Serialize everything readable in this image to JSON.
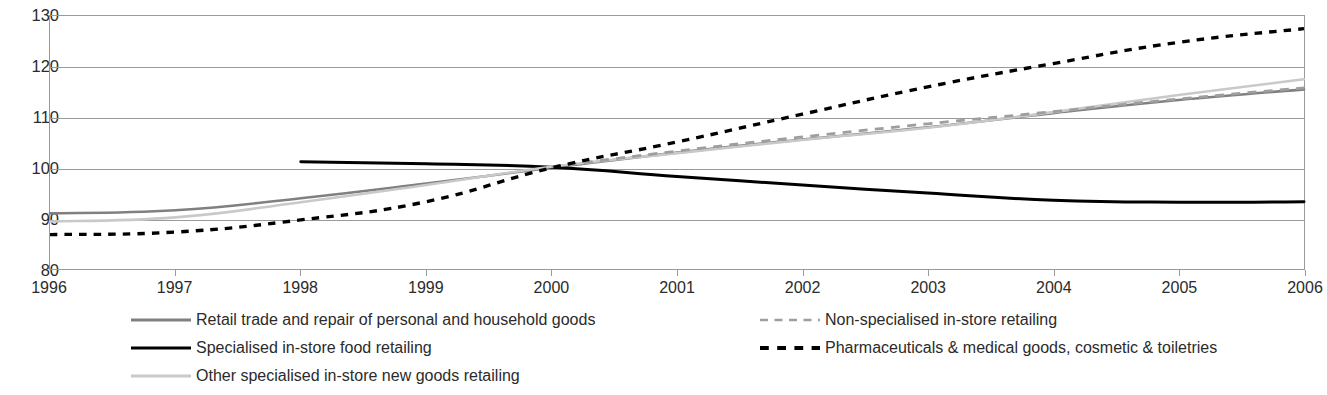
{
  "chart_data": {
    "type": "line",
    "title": "",
    "subtitle": "",
    "xlabel": "",
    "ylabel": "",
    "x": [
      1996,
      1997,
      1998,
      1999,
      2000,
      2001,
      2002,
      2003,
      2004,
      2005,
      2006
    ],
    "categories": [
      "1996",
      "1997",
      "1998",
      "1999",
      "2000",
      "2001",
      "2002",
      "2003",
      "2004",
      "2005",
      "2006"
    ],
    "xlim": [
      1996,
      2006
    ],
    "ylim": [
      80,
      130
    ],
    "yticks": [
      80,
      90,
      100,
      110,
      120,
      130
    ],
    "grid": true,
    "legend_position": "bottom",
    "index_base_year": 2000,
    "index_base_value": 100,
    "series": [
      {
        "name": "Retail trade and repair of personal and household goods",
        "color": "#808080",
        "style": "solid",
        "width": 2.6,
        "x": [
          1996,
          1997,
          1998,
          1999,
          2000,
          2001,
          2002,
          2003,
          2004,
          2005,
          2006
        ],
        "values": [
          91.0,
          91.6,
          94.0,
          96.9,
          100.0,
          103.0,
          105.6,
          108.0,
          110.8,
          113.4,
          115.5
        ]
      },
      {
        "name": "Specialised in-store food retailing",
        "color": "#000000",
        "style": "solid",
        "width": 3.0,
        "x": [
          1998,
          1999,
          2000,
          2001,
          2002,
          2003,
          2004,
          2005,
          2006
        ],
        "values": [
          101.2,
          100.8,
          100.1,
          98.3,
          96.6,
          95.0,
          93.6,
          93.2,
          93.3
        ]
      },
      {
        "name": "Other specialised in-store new goods retailing",
        "color": "#c9c9c9",
        "style": "solid",
        "width": 2.6,
        "x": [
          1996,
          1997,
          1998,
          1999,
          2000,
          2001,
          2002,
          2003,
          2004,
          2005,
          2006
        ],
        "values": [
          89.4,
          90.2,
          93.2,
          96.6,
          100.2,
          102.9,
          105.5,
          107.9,
          111.0,
          114.4,
          117.5
        ]
      },
      {
        "name": "Non-specialised in-store retailing",
        "color": "#9e9e9e",
        "style": "dashed",
        "width": 2.8,
        "x": [
          2000,
          2001,
          2002,
          2003,
          2004,
          2005,
          2006
        ],
        "values": [
          100.2,
          103.3,
          106.1,
          108.7,
          111.1,
          113.6,
          115.8
        ]
      },
      {
        "name": "Pharmaceuticals & medical goods, cosmetic & toiletries",
        "color": "#000000",
        "style": "dotted",
        "width": 3.4,
        "x": [
          1996,
          1997,
          1998,
          1999,
          2000,
          2001,
          2002,
          2003,
          2004,
          2005,
          2006
        ],
        "values": [
          86.8,
          87.3,
          89.7,
          93.3,
          100.0,
          105.1,
          110.6,
          116.0,
          120.6,
          124.8,
          127.5
        ]
      }
    ]
  },
  "axis": {
    "y_tick_labels": [
      "130",
      "120",
      "110",
      "100",
      "90",
      "80"
    ],
    "x_tick_labels": [
      "1996",
      "1997",
      "1998",
      "1999",
      "2000",
      "2001",
      "2002",
      "2003",
      "2004",
      "2005",
      "2006"
    ]
  },
  "legend": {
    "entries": [
      {
        "label": "Retail trade and repair of personal and household goods",
        "icon": "solid-line-swatch-gray",
        "color": "#808080",
        "style": "solid",
        "column": "left",
        "row": 0
      },
      {
        "label": "Specialised in-store food retailing",
        "icon": "solid-line-swatch-black",
        "color": "#000000",
        "style": "solid",
        "column": "left",
        "row": 1
      },
      {
        "label": "Other specialised in-store new goods retailing",
        "icon": "solid-line-swatch-light-gray",
        "color": "#c9c9c9",
        "style": "solid",
        "column": "left",
        "row": 2
      },
      {
        "label": "Non-specialised in-store retailing",
        "icon": "dashed-line-swatch-gray",
        "color": "#9e9e9e",
        "style": "dashed",
        "column": "right",
        "row": 0
      },
      {
        "label": "Pharmaceuticals & medical goods, cosmetic & toiletries",
        "icon": "dotted-line-swatch-black",
        "color": "#000000",
        "style": "dotted",
        "column": "right",
        "row": 1
      }
    ]
  },
  "colors": {
    "background": "#ffffff",
    "axis": "#9a9a9a",
    "text": "#2b2b2b",
    "series_retail_trade": "#808080",
    "series_food": "#000000",
    "series_other_specialised": "#c9c9c9",
    "series_non_specialised": "#9e9e9e",
    "series_pharmaceuticals": "#000000"
  }
}
